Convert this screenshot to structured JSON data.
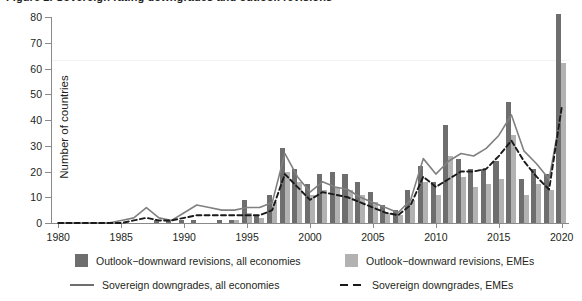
{
  "title": "Figure 2. Sovereign rating downgrades and outlook revisions",
  "chart_data": {
    "type": "bar",
    "title": "Sovereign rating downgrades and outlook revisions",
    "xlabel": "",
    "ylabel": "Number of countries",
    "ylim": [
      0,
      80
    ],
    "xlim": [
      1980,
      2020
    ],
    "yticks": [
      0,
      10,
      20,
      30,
      40,
      50,
      60,
      70,
      80
    ],
    "xticks": [
      1980,
      1985,
      1990,
      1995,
      2000,
      2005,
      2010,
      2015,
      2020
    ],
    "grid": false,
    "legend_position": "bottom",
    "x": [
      1980,
      1981,
      1982,
      1983,
      1984,
      1985,
      1986,
      1987,
      1988,
      1989,
      1990,
      1991,
      1992,
      1993,
      1994,
      1995,
      1996,
      1997,
      1998,
      1999,
      2000,
      2001,
      2002,
      2003,
      2004,
      2005,
      2006,
      2007,
      2008,
      2009,
      2010,
      2011,
      2012,
      2013,
      2014,
      2015,
      2016,
      2017,
      2018,
      2019,
      2020
    ],
    "series": [
      {
        "name": "Outlook−downward revisions, all economies",
        "type": "bar",
        "color": "#6e6e6e",
        "values": [
          0,
          0,
          0,
          0,
          0,
          0,
          0,
          0,
          1,
          1,
          1,
          1,
          0,
          1,
          1,
          9,
          3,
          11,
          29,
          21,
          15,
          19,
          20,
          19,
          16,
          12,
          7,
          5,
          13,
          22,
          16,
          38,
          25,
          21,
          21,
          24,
          47,
          17,
          21,
          19,
          81
        ]
      },
      {
        "name": "Outlook−downward revisions, EMEs",
        "type": "bar",
        "color": "#b2b2b2",
        "values": [
          0,
          0,
          0,
          0,
          0,
          0,
          0,
          0,
          0,
          0,
          0,
          0,
          0,
          0,
          1,
          4,
          2,
          8,
          20,
          16,
          11,
          13,
          14,
          13,
          11,
          8,
          4,
          3,
          9,
          16,
          11,
          26,
          18,
          14,
          15,
          17,
          34,
          11,
          15,
          13,
          62
        ]
      },
      {
        "name": "Sovereign downgrades, all economies",
        "type": "line",
        "style": "solid",
        "color": "#808080",
        "values": [
          0,
          0,
          0,
          0,
          0,
          1,
          2,
          6,
          2,
          1,
          4,
          7,
          6,
          5,
          5,
          6,
          6,
          8,
          27,
          18,
          12,
          16,
          14,
          13,
          10,
          8,
          6,
          4,
          9,
          25,
          19,
          24,
          27,
          26,
          29,
          34,
          42,
          28,
          23,
          17,
          44
        ]
      },
      {
        "name": "Sovereign downgrades, EMEs",
        "type": "line",
        "style": "dashed",
        "color": "#1a1a1a",
        "values": [
          0,
          0,
          0,
          0,
          0,
          0,
          1,
          2,
          1,
          1,
          2,
          3,
          3,
          3,
          3,
          3,
          3,
          5,
          19,
          14,
          9,
          12,
          11,
          10,
          8,
          6,
          4,
          3,
          7,
          18,
          14,
          17,
          20,
          20,
          21,
          26,
          32,
          24,
          18,
          13,
          45
        ]
      }
    ]
  },
  "legend": {
    "items": [
      {
        "label": "Outlook−downward revisions, all economies",
        "marker": "swatch-dark"
      },
      {
        "label": "Outlook−downward revisions, EMEs",
        "marker": "swatch-light"
      },
      {
        "label": "Sovereign downgrades, all economies",
        "marker": "line-solid"
      },
      {
        "label": "Sovereign downgrades, EMEs",
        "marker": "line-dashed"
      }
    ]
  }
}
